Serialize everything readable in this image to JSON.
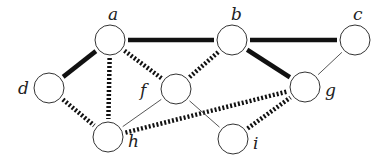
{
  "graph": {
    "node_radius": 15,
    "nodes": [
      {
        "id": "a",
        "label": "a",
        "x": 110,
        "y": 40,
        "lx": 108,
        "ly": 20
      },
      {
        "id": "b",
        "label": "b",
        "x": 232,
        "y": 40,
        "lx": 231,
        "ly": 20
      },
      {
        "id": "c",
        "label": "c",
        "x": 355,
        "y": 40,
        "lx": 353,
        "ly": 20
      },
      {
        "id": "d",
        "label": "d",
        "x": 49,
        "y": 88,
        "lx": 18,
        "ly": 94
      },
      {
        "id": "f",
        "label": "f",
        "x": 176,
        "y": 89,
        "lx": 140,
        "ly": 96
      },
      {
        "id": "g",
        "label": "g",
        "x": 305,
        "y": 87,
        "lx": 325,
        "ly": 96
      },
      {
        "id": "h",
        "label": "h",
        "x": 108,
        "y": 137,
        "lx": 128,
        "ly": 147
      },
      {
        "id": "i",
        "label": "i",
        "x": 233,
        "y": 139,
        "lx": 253,
        "ly": 149
      }
    ],
    "edges": [
      {
        "from": "a",
        "to": "b",
        "style": "thick-solid"
      },
      {
        "from": "b",
        "to": "c",
        "style": "thick-solid"
      },
      {
        "from": "a",
        "to": "d",
        "style": "thick-solid"
      },
      {
        "from": "b",
        "to": "g",
        "style": "thick-solid"
      },
      {
        "from": "a",
        "to": "h",
        "style": "thick-dashed"
      },
      {
        "from": "a",
        "to": "f",
        "style": "thick-dashed"
      },
      {
        "from": "f",
        "to": "b",
        "style": "thick-dashed"
      },
      {
        "from": "d",
        "to": "h",
        "style": "thick-dashed"
      },
      {
        "from": "h",
        "to": "g",
        "style": "thick-dashed"
      },
      {
        "from": "i",
        "to": "g",
        "style": "thick-dashed"
      },
      {
        "from": "c",
        "to": "g",
        "style": "thin-solid"
      },
      {
        "from": "f",
        "to": "h",
        "style": "thin-solid"
      },
      {
        "from": "f",
        "to": "i",
        "style": "thin-solid"
      }
    ],
    "colors": {
      "stroke": "#111111",
      "node_stroke": "#333333",
      "node_fill": "#ffffff"
    }
  }
}
